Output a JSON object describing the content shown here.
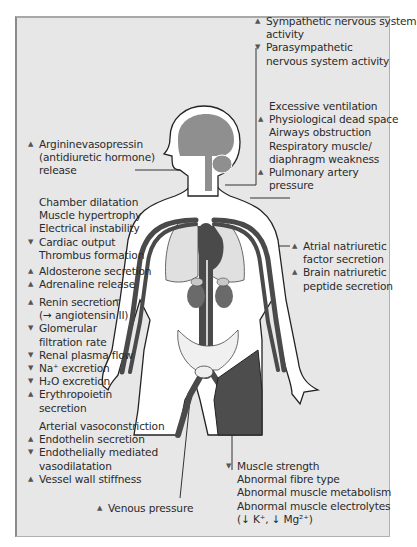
{
  "colors": {
    "panel_bg": "#e7e7e7",
    "panel_border": "#8a8a8a",
    "body_fill": "#ffffff",
    "body_outline": "#222222",
    "vessel_dark": "#4a4a4a",
    "organ_gray": "#8f8f8f",
    "muscle_dark": "#4d4d4d",
    "pelvis_light": "#e0e0e0",
    "leader_line": "#333333"
  },
  "icons": {
    "increase": "▲",
    "decrease": "▼"
  },
  "labels": {
    "nervous_system": [
      {
        "arrow": "up",
        "text": "Sympathetic nervous system"
      },
      {
        "arrow": "",
        "text": "activity"
      },
      {
        "arrow": "down",
        "text": "Parasympathetic"
      },
      {
        "arrow": "",
        "text": "nervous system activity"
      }
    ],
    "lungs": [
      {
        "arrow": "",
        "text": "Excessive ventilation"
      },
      {
        "arrow": "up",
        "text": "Physiological dead space"
      },
      {
        "arrow": "",
        "text": "Airways obstruction"
      },
      {
        "arrow": "",
        "text": "Respiratory muscle/"
      },
      {
        "arrow": "",
        "text": "diaphragm weakness"
      },
      {
        "arrow": "up",
        "text": "Pulmonary artery"
      },
      {
        "arrow": "",
        "text": "pressure"
      }
    ],
    "pituitary": [
      {
        "arrow": "up",
        "text": "Argininevasopressin"
      },
      {
        "arrow": "",
        "text": "(antidiuretic hormone)"
      },
      {
        "arrow": "",
        "text": "release"
      }
    ],
    "heart": [
      {
        "arrow": "",
        "text": "Chamber dilatation"
      },
      {
        "arrow": "",
        "text": "Muscle hypertrophy"
      },
      {
        "arrow": "",
        "text": "Electrical instability"
      },
      {
        "arrow": "down",
        "text": "Cardiac output"
      },
      {
        "arrow": "",
        "text": "Thrombus formation"
      }
    ],
    "adrenal": [
      {
        "arrow": "up",
        "text": "Aldosterone secretion"
      },
      {
        "arrow": "up",
        "text": "Adrenaline release"
      }
    ],
    "kidney": [
      {
        "arrow": "up",
        "text": "Renin secretion"
      },
      {
        "arrow": "",
        "text": "(→ angiotensin II)"
      },
      {
        "arrow": "down",
        "text": "Glomerular"
      },
      {
        "arrow": "",
        "text": "filtration rate"
      },
      {
        "arrow": "down",
        "text": "Renal plasma flow"
      },
      {
        "arrow": "down",
        "text": "Na⁺ excretion"
      },
      {
        "arrow": "down",
        "text": "H₂O excretion"
      },
      {
        "arrow": "up",
        "text": "Erythropoietin"
      },
      {
        "arrow": "",
        "text": "secretion"
      }
    ],
    "natriuretic": [
      {
        "arrow": "up",
        "text": "Atrial natriuretic"
      },
      {
        "arrow": "",
        "text": "factor secretion"
      },
      {
        "arrow": "up",
        "text": "Brain natriuretic"
      },
      {
        "arrow": "",
        "text": "peptide secretion"
      }
    ],
    "arteries": [
      {
        "arrow": "",
        "text": "Arterial vasoconstriction"
      },
      {
        "arrow": "up",
        "text": "Endothelin secretion"
      },
      {
        "arrow": "down",
        "text": "Endothelially mediated"
      },
      {
        "arrow": "",
        "text": "vasodilatation"
      },
      {
        "arrow": "up",
        "text": "Vessel wall stiffness"
      }
    ],
    "veins": [
      {
        "arrow": "up",
        "text": "Venous pressure"
      }
    ],
    "muscle": [
      {
        "arrow": "down",
        "text": "Muscle strength"
      },
      {
        "arrow": "",
        "text": "Abnormal fibre type"
      },
      {
        "arrow": "",
        "text": "Abnormal muscle metabolism"
      },
      {
        "arrow": "",
        "text": "Abnormal muscle electrolytes"
      },
      {
        "arrow": "",
        "text": "(↓ K⁺, ↓ Mg²⁺)"
      }
    ]
  }
}
